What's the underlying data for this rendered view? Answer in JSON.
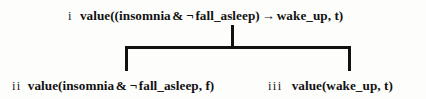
{
  "diagram": {
    "type": "proof-tree",
    "background_color": "#fdfdfc",
    "line_color": "#111111",
    "text_color": "#111111",
    "nodes": [
      {
        "id": "root",
        "numeral": "i",
        "formula_parts": {
          "prefix": "value((insomnia",
          "and": "&",
          "not": "¬",
          "operand": "fall_asleep)",
          "arrow": "→",
          "suffix": "wake_up, t)"
        },
        "formula_full": "value((insomnia & ¬ fall_asleep) → wake_up, t)"
      },
      {
        "id": "child-left",
        "numeral": "ii",
        "formula_parts": {
          "prefix": "value(insomnia",
          "and": "&",
          "not": "¬",
          "operand": "fall_asleep, f)"
        },
        "formula_full": "value(insomnia & ¬ fall_asleep, f)"
      },
      {
        "id": "child-right",
        "numeral": "iii",
        "formula_parts": {
          "prefix": "value(wake_up, t)"
        },
        "formula_full": "value(wake_up, t)"
      }
    ],
    "connectors": {
      "stem_label": "root-stem",
      "bar_label": "branch-bar",
      "left_leg_label": "left-branch-leg",
      "right_leg_label": "right-branch-leg"
    }
  }
}
